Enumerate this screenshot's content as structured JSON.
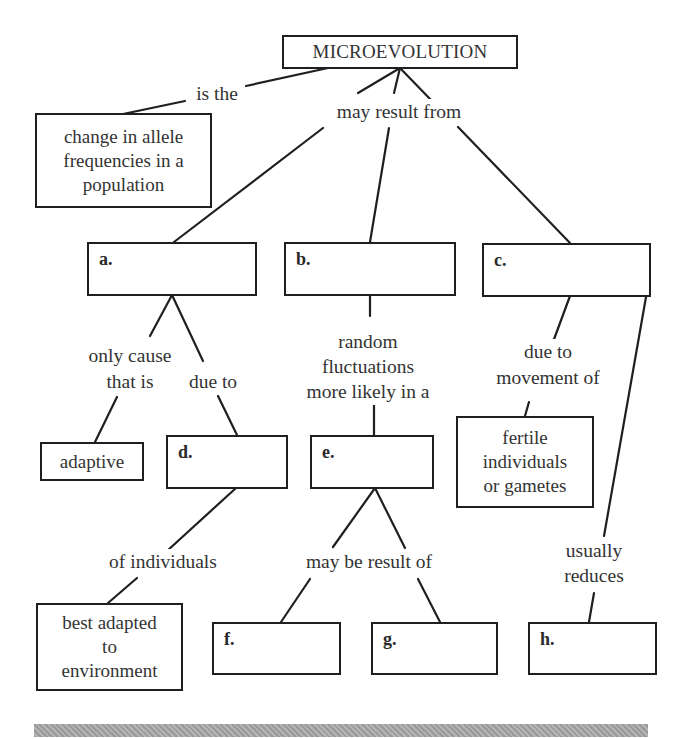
{
  "diagram": {
    "type": "concept-map",
    "root": {
      "label": "MICROEVOLUTION"
    },
    "concepts": {
      "definition": "change in allele frequencies in a population",
      "adaptive": "adaptive",
      "best_adapted": "best adapted to environment",
      "fertile": "fertile individuals or gametes"
    },
    "blanks": {
      "a": "a.",
      "b": "b.",
      "c": "c.",
      "d": "d.",
      "e": "e.",
      "f": "f.",
      "g": "g.",
      "h": "h."
    },
    "link_labels": {
      "is_the": "is the",
      "may_result_from": "may result from",
      "only_cause_1": "only cause",
      "only_cause_2": "that is",
      "due_to_a": "due to",
      "random_1": "random",
      "random_2": "fluctuations",
      "random_3": "more likely in a",
      "due_to_c_1": "due to",
      "due_to_c_2": "movement of",
      "of_individuals": "of individuals",
      "may_be_result_of": "may be result of",
      "usually_1": "usually",
      "usually_2": "reduces"
    },
    "definition_lines": [
      "change in allele",
      "frequencies in a",
      "population"
    ],
    "best_adapted_lines": [
      "best adapted",
      "to",
      "environment"
    ],
    "fertile_lines": [
      "fertile",
      "individuals",
      "or gametes"
    ],
    "edges": [
      {
        "from": "MICROEVOLUTION",
        "label": "is the",
        "to": "change in allele frequencies in a population"
      },
      {
        "from": "MICROEVOLUTION",
        "label": "may result from",
        "to": "a."
      },
      {
        "from": "MICROEVOLUTION",
        "label": "may result from",
        "to": "b."
      },
      {
        "from": "MICROEVOLUTION",
        "label": "may result from",
        "to": "c."
      },
      {
        "from": "a.",
        "label": "only cause that is",
        "to": "adaptive"
      },
      {
        "from": "a.",
        "label": "due to",
        "to": "d."
      },
      {
        "from": "d.",
        "label": "of individuals",
        "to": "best adapted to environment"
      },
      {
        "from": "b.",
        "label": "random fluctuations more likely in a",
        "to": "e."
      },
      {
        "from": "e.",
        "label": "may be result of",
        "to": "f."
      },
      {
        "from": "e.",
        "label": "may be result of",
        "to": "g."
      },
      {
        "from": "c.",
        "label": "due to movement of",
        "to": "fertile individuals or gametes"
      },
      {
        "from": "c.",
        "label": "usually reduces",
        "to": "h."
      }
    ]
  }
}
